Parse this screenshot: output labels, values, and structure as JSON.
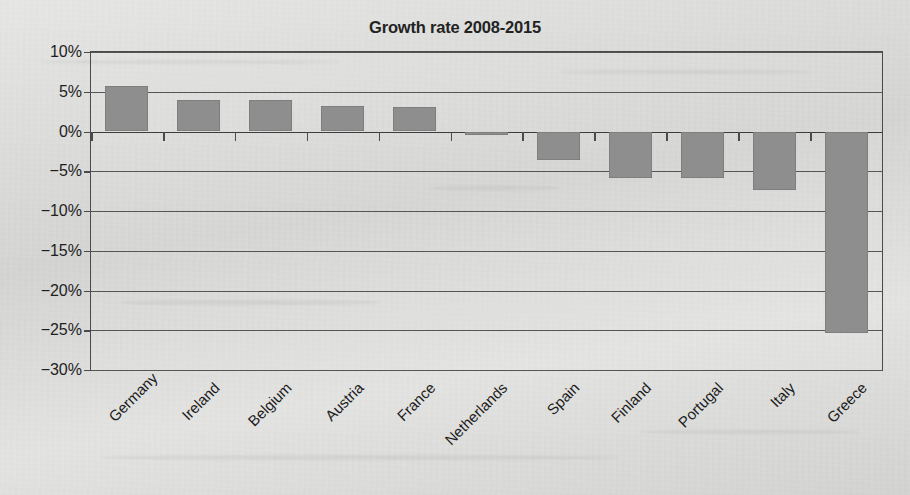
{
  "chart_data": {
    "type": "bar",
    "title": "Growth rate 2008-2015",
    "xlabel": "",
    "ylabel": "",
    "categories": [
      "Germany",
      "Ireland",
      "Belgium",
      "Austria",
      "France",
      "Netherlands",
      "Spain",
      "Finland",
      "Portugal",
      "Italy",
      "Greece"
    ],
    "values": [
      5.7,
      4.0,
      4.0,
      3.2,
      3.1,
      -0.4,
      -3.6,
      -5.8,
      -5.8,
      -7.4,
      -25.3
    ],
    "value_unit": "%",
    "ylim": [
      -30,
      10
    ],
    "ytick_labels": [
      "10%",
      "5%",
      "0%",
      "−5%",
      "−10%",
      "−15%",
      "−20%",
      "−25%",
      "−30%"
    ],
    "ytick_values": [
      10,
      5,
      0,
      -5,
      -10,
      -15,
      -20,
      -25,
      -30
    ],
    "grid": true,
    "legend": "none",
    "series_color": "#8e8e8e",
    "axis_color": "#4a4a4a",
    "background_color": "#dcdcda"
  }
}
